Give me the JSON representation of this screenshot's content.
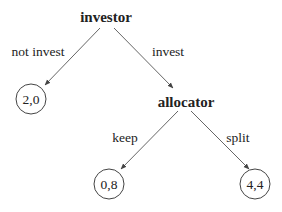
{
  "diagram": {
    "type": "game-tree",
    "nodes": [
      {
        "id": "investor",
        "label": "investor",
        "x": 106,
        "y": 22
      },
      {
        "id": "allocator",
        "label": "allocator",
        "x": 186,
        "y": 107
      }
    ],
    "leaves": [
      {
        "id": "leaf-not-invest",
        "payoff": "2,0",
        "cx": 31,
        "cy": 99
      },
      {
        "id": "leaf-keep",
        "payoff": "0,8",
        "cx": 109,
        "cy": 184
      },
      {
        "id": "leaf-split",
        "payoff": "4,4",
        "cx": 255,
        "cy": 184
      }
    ],
    "edges": [
      {
        "from": "investor",
        "to": "leaf-not-invest",
        "label": "not invest"
      },
      {
        "from": "investor",
        "to": "allocator",
        "label": "invest"
      },
      {
        "from": "allocator",
        "to": "leaf-keep",
        "label": "keep"
      },
      {
        "from": "allocator",
        "to": "leaf-split",
        "label": "split"
      }
    ]
  }
}
